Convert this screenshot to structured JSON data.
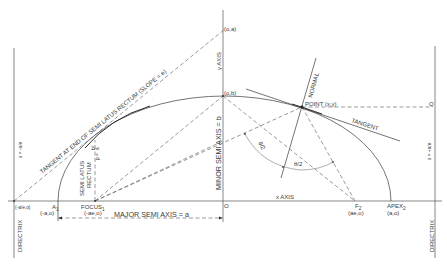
{
  "diagram": {
    "type": "ellipse-geometry",
    "labels": {
      "y_axis": "y AXIS",
      "x_axis": "x AXIS",
      "point_oa": "(o,a)",
      "point_ob": "(o,b)",
      "origin": "O",
      "point_xy": "POINT (x,y)",
      "normal": "NORMAL",
      "tangent": "TANGENT",
      "q": "Q",
      "tangent_latus": "TANGENT AT END OF SEMI LATUS RECTUM (SLOPE = e)",
      "semi_latus": "SEMI LATUS",
      "rectum": "RECTUM",
      "p_eq": "p =",
      "b2": "b²",
      "over_a": "a",
      "minor_semi_axis": "MINOR SEMI AXIS = b",
      "major_semi_axis": "MAJOR SEMI AXIS = a",
      "focus1": "FOCUS",
      "focus1_sub": "1",
      "focus1_coord": "(-ae,o)",
      "a1": "A",
      "a1_sub": "1",
      "a1_coord": "(-a,o)",
      "f2": "F",
      "f2_sub": "2",
      "f2_coord": "(ae,o)",
      "apex2": "APEX",
      "apex2_sub": "2",
      "apex2_coord": "(a,o)",
      "left_dir_coord": "(-a/e,o)",
      "left_dir_eq": "x = -a/e",
      "right_dir_eq": "x = +a/e",
      "directrix_left": "DIRECTRIX",
      "directrix_right": "DIRECTRIX",
      "theta_half_1": "θ/2",
      "theta_half_2": "θ/2"
    },
    "colors": {
      "line": "#3a3a3a",
      "directrix": "#999999",
      "background": "#ffffff"
    }
  }
}
